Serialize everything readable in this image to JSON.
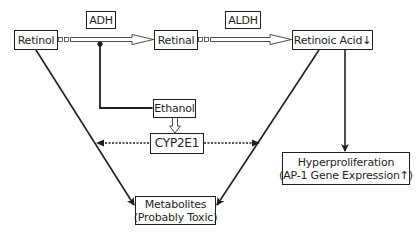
{
  "diagram": {
    "nodes": {
      "retinol": {
        "label": "Retinol"
      },
      "adh": {
        "label": "ADH"
      },
      "retinal": {
        "label": "Retinal"
      },
      "aldh": {
        "label": "ALDH"
      },
      "retinoic_acid": {
        "label": "Retinoic Acid↓"
      },
      "ethanol": {
        "label": "Ethanol"
      },
      "cyp2e1": {
        "label": "CYP2E1"
      },
      "hyperproliferation": {
        "line1": "Hyperproliferation",
        "line2": "(AP-1 Gene Expression↑)"
      },
      "metabolites": {
        "line1": "Metabolites",
        "line2": "(Probably Toxic)"
      }
    },
    "edges": [
      {
        "from": "Retinol",
        "to": "Retinal",
        "style": "hollow-arrow",
        "enzyme": "ADH"
      },
      {
        "from": "Retinal",
        "to": "Retinoic Acid",
        "style": "hollow-arrow",
        "enzyme": "ALDH"
      },
      {
        "from": "Ethanol",
        "to": "ADH step",
        "style": "inhibition-line"
      },
      {
        "from": "Ethanol",
        "to": "CYP2E1",
        "style": "hollow-arrow"
      },
      {
        "from": "CYP2E1",
        "to": "Retinol→Metabolites pathway",
        "style": "dotted-arrow"
      },
      {
        "from": "CYP2E1",
        "to": "Retinoic Acid→Metabolites pathway",
        "style": "dotted-arrow"
      },
      {
        "from": "Retinol",
        "to": "Metabolites",
        "style": "solid-arrow"
      },
      {
        "from": "Retinoic Acid",
        "to": "Metabolites",
        "style": "solid-arrow"
      },
      {
        "from": "Retinoic Acid",
        "to": "Hyperproliferation",
        "style": "solid-arrow"
      }
    ],
    "colors": {
      "stroke": "#231f20",
      "background": "#ffffff"
    }
  }
}
